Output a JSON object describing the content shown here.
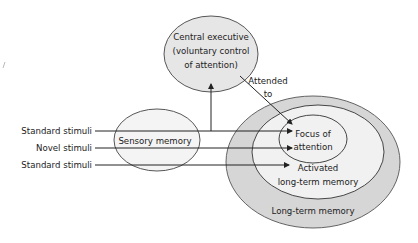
{
  "diagram": {
    "central_executive": {
      "lines": [
        "Central executive",
        "(voluntary control",
        "of attention)"
      ]
    },
    "sensory_memory": {
      "label": "Sensory memory"
    },
    "focus_of_attention": {
      "lines": [
        "Focus of",
        "attention"
      ]
    },
    "activated_ltm": {
      "lines": [
        "Activated",
        "long-term memory"
      ]
    },
    "long_term_memory": {
      "label": "Long-term memory"
    },
    "attended_label": {
      "lines": [
        "Attended",
        "to"
      ]
    },
    "stimuli": [
      {
        "label": "Standard stimuli",
        "target": "focus-of-attention"
      },
      {
        "label": "Novel stimuli",
        "target": "focus-of-attention"
      },
      {
        "label": "Standard stimuli",
        "target": "activated-long-term-memory"
      }
    ],
    "colors": {
      "central_executive_fill": "#e6e6e6",
      "sensory_fill": "#f4f4f4",
      "ltm_fill": "#d6d6d6",
      "activated_fill": "#f1f1f1",
      "focus_fill": "#f1f1f1",
      "stroke": "#2a2a2a"
    }
  }
}
